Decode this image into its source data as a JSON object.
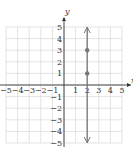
{
  "chart_data": {
    "type": "line",
    "title": "",
    "xlabel": "x",
    "ylabel": "y",
    "xlim": [
      -5,
      5
    ],
    "ylim": [
      -5,
      5
    ],
    "grid": true,
    "x_ticks": [
      "−5",
      "−4",
      "−3",
      "−2",
      "−1",
      "1",
      "2",
      "3",
      "4",
      "5"
    ],
    "x_tick_values": [
      -5,
      -4,
      -3,
      -2,
      -1,
      1,
      2,
      3,
      4,
      5
    ],
    "y_ticks": [
      "5",
      "4",
      "3",
      "2",
      "1",
      "−1",
      "−2",
      "−3",
      "−4",
      "−5"
    ],
    "y_tick_values": [
      5,
      4,
      3,
      2,
      1,
      -1,
      -2,
      -3,
      -4,
      -5
    ],
    "series": [
      {
        "name": "x = 2",
        "kind": "vertical-line",
        "x": 2,
        "arrows": "both",
        "color": "#777777"
      }
    ],
    "points": [
      {
        "x": 2,
        "y": 3
      },
      {
        "x": 2,
        "y": 1
      }
    ],
    "colors": {
      "grid": "#dcdcdc",
      "axis": "#333333",
      "line": "#777777",
      "point": "#777777"
    }
  }
}
